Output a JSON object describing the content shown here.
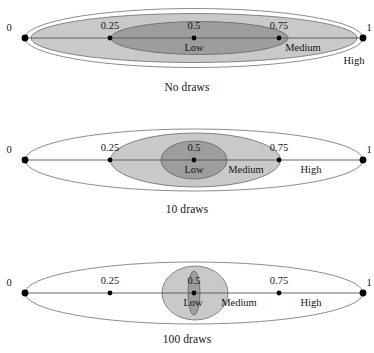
{
  "figure": {
    "width": 374,
    "height": 353,
    "background": "#ffffff",
    "axis_color": "#555555",
    "outline_color": "#5a5a5a",
    "colors": {
      "outer_fill": "#ffffff",
      "mid_fill": "#c9c9c9",
      "dark_fill": "#9d9d9d",
      "dot": "#000000",
      "text": "#141414"
    }
  },
  "chart_data": {
    "type": "diagram",
    "title": "",
    "subtitle": "",
    "xlabel": "",
    "ylabel": "",
    "xlim": [
      0,
      1
    ],
    "grid": false,
    "legend": "none",
    "axis": {
      "tick_values": [
        0,
        0.25,
        0.5,
        0.75,
        1
      ],
      "tick_labels": [
        "0",
        "0.25",
        "0.5",
        "0.75",
        "1"
      ],
      "tick_x_px": [
        25,
        110,
        194,
        279,
        363
      ],
      "endpoint_labels": [
        "0",
        "1"
      ]
    },
    "zone_labels": [
      "Low",
      "Medium",
      "High"
    ],
    "panels": [
      {
        "id": "no-draws",
        "caption": "No draws",
        "caption_y": 81,
        "axis_y": 38,
        "ellipses": [
          {
            "name": "outer-region",
            "fill": "outer_fill",
            "cx": 194,
            "cy": 38,
            "rx": 169,
            "ry": 29.5
          },
          {
            "name": "medium-region",
            "fill": "mid_fill",
            "cx": 194,
            "cy": 38,
            "rx": 163,
            "ry": 24.5
          },
          {
            "name": "low-region",
            "fill": "dark_fill",
            "cx": 199.5,
            "cy": 38,
            "rx": 88.5,
            "ry": 16.5
          }
        ],
        "zone_label_positions": [
          {
            "label": "Low",
            "x": 194,
            "y": 42
          },
          {
            "label": "Medium",
            "x": 303,
            "y": 42
          },
          {
            "label": "High",
            "x": 354,
            "y": 55
          }
        ],
        "tick_label_positions": [
          {
            "label": "0",
            "x": 9,
            "y": 22
          },
          {
            "label": "0.25",
            "x": 110,
            "y": 20
          },
          {
            "label": "0.5",
            "x": 194,
            "y": 20
          },
          {
            "label": "0.75",
            "x": 279,
            "y": 20
          },
          {
            "label": "1",
            "x": 369,
            "y": 22
          }
        ]
      },
      {
        "id": "ten-draws",
        "caption": "10 draws",
        "caption_y": 203,
        "axis_y": 160,
        "ellipses": [
          {
            "name": "outer-region",
            "fill": "outer_fill",
            "cx": 194,
            "cy": 160,
            "rx": 169,
            "ry": 31
          },
          {
            "name": "medium-region",
            "fill": "mid_fill",
            "cx": 195.5,
            "cy": 160,
            "rx": 85,
            "ry": 27
          },
          {
            "name": "low-region",
            "fill": "dark_fill",
            "cx": 194,
            "cy": 160,
            "rx": 33,
            "ry": 19
          }
        ],
        "zone_label_positions": [
          {
            "label": "Low",
            "x": 194,
            "y": 164
          },
          {
            "label": "Medium",
            "x": 246,
            "y": 164
          },
          {
            "label": "High",
            "x": 311,
            "y": 164
          }
        ],
        "tick_label_positions": [
          {
            "label": "0",
            "x": 9,
            "y": 144
          },
          {
            "label": "0.25",
            "x": 110,
            "y": 142
          },
          {
            "label": "0.5",
            "x": 194,
            "y": 142
          },
          {
            "label": "0.75",
            "x": 279,
            "y": 142
          },
          {
            "label": "1",
            "x": 369,
            "y": 144
          }
        ]
      },
      {
        "id": "hundred-draws",
        "caption": "100 draws",
        "caption_y": 333,
        "axis_y": 293,
        "ellipses": [
          {
            "name": "outer-region",
            "fill": "outer_fill",
            "cx": 194,
            "cy": 293,
            "rx": 169,
            "ry": 31
          },
          {
            "name": "medium-region",
            "fill": "mid_fill",
            "cx": 195,
            "cy": 293,
            "rx": 33,
            "ry": 27
          },
          {
            "name": "low-region",
            "fill": "dark_fill",
            "cx": 194,
            "cy": 293,
            "rx": 6,
            "ry": 22
          }
        ],
        "zone_label_positions": [
          {
            "label": "Low",
            "x": 193,
            "y": 297
          },
          {
            "label": "Medium",
            "x": 239,
            "y": 297
          },
          {
            "label": "High",
            "x": 311,
            "y": 297
          }
        ],
        "tick_label_positions": [
          {
            "label": "0",
            "x": 9,
            "y": 277
          },
          {
            "label": "0.25",
            "x": 110,
            "y": 275
          },
          {
            "label": "0.5",
            "x": 194,
            "y": 275
          },
          {
            "label": "0.75",
            "x": 279,
            "y": 275
          },
          {
            "label": "1",
            "x": 369,
            "y": 277
          }
        ]
      }
    ]
  }
}
